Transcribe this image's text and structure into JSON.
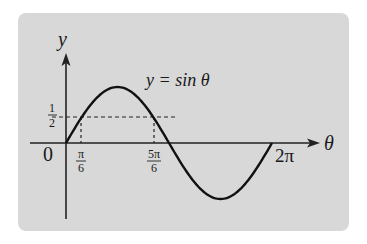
{
  "chart_data": {
    "type": "line",
    "title": "",
    "function_label": "y = sin θ",
    "xlabel": "θ",
    "ylabel": "y",
    "x_ticks": [
      "0",
      "π/6",
      "5π/6",
      "2π"
    ],
    "y_ticks": [
      "1/2"
    ],
    "xlim": [
      0,
      6.2832
    ],
    "ylim": [
      -1,
      1
    ],
    "grid": false,
    "legend": "none",
    "series": [
      {
        "name": "y = sin θ",
        "x": [
          0,
          0.5236,
          1.5708,
          2.618,
          3.1416,
          4.7124,
          6.2832
        ],
        "values": [
          0,
          0.5,
          1,
          0.5,
          0,
          -1,
          0
        ]
      }
    ],
    "annotations": [
      {
        "type": "dashed-horizontal",
        "y": 0.5,
        "label": "1/2"
      },
      {
        "type": "dashed-vertical",
        "x": 0.5236,
        "label": "π/6"
      },
      {
        "type": "dashed-vertical",
        "x": 2.618,
        "label": "5π/6"
      }
    ]
  },
  "labels": {
    "y_axis": "y",
    "x_axis": "θ",
    "origin": "0",
    "curve": "y = sin θ",
    "half_num": "1",
    "half_den": "2",
    "pi6_num": "π",
    "pi6_den": "6",
    "fivepi6_num": "5π",
    "fivepi6_den": "6",
    "twopi": "2π"
  }
}
